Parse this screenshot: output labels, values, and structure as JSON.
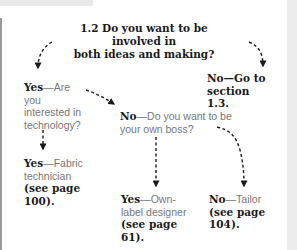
{
  "question": {
    "line1": "1.2 Do you want to be involved in",
    "line2": "both ideas and making?"
  },
  "nodes": {
    "yes_tech": {
      "bold": "Yes",
      "text": "—Are you interested in technology?"
    },
    "no_goto": {
      "bold": "No—Go to section 1.3."
    },
    "no_boss": {
      "bold": "No",
      "text": "—Do you want to be your own boss?"
    },
    "yes_fabric": {
      "bold": "Yes",
      "text": "—Fabric technician ",
      "ref": "(see page 100)."
    },
    "yes_ownlabel": {
      "bold": "Yes",
      "text": "—Own-label designer ",
      "ref": "(see page 61)."
    },
    "no_tailor": {
      "bold": "No",
      "text": "—Tailor ",
      "ref": "(see page 104)."
    }
  },
  "colors": {
    "text": "#1a1a1a",
    "muted": "#777777",
    "arrow": "#1a1a1a",
    "page_edge": "#e9e9e9"
  }
}
